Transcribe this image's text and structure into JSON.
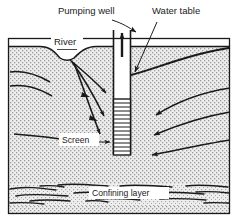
{
  "figure": {
    "type": "cross-section-diagram",
    "background_color": "#ffffff",
    "line_color": "#1a1a1a",
    "aquifer_fill": "#e8e8e8",
    "frame": {
      "x": 8,
      "y": 38,
      "width": 222,
      "height": 176
    }
  },
  "labels": {
    "pumping_well": "Pumping well",
    "water_table": "Water table",
    "river": "River",
    "screen": "Screen",
    "confining_layer": "Confining layer"
  },
  "label_positions": {
    "pumping_well": {
      "x": 58,
      "y": 14
    },
    "water_table": {
      "x": 152,
      "y": 14
    },
    "river": {
      "x": 54,
      "y": 45
    },
    "screen": {
      "x": 62,
      "y": 142
    },
    "confining_layer": {
      "x": 92,
      "y": 196
    }
  },
  "elements": {
    "well": {
      "name": "pumping-well-casing",
      "casing_left_x": 113,
      "casing_right_x": 131,
      "top_y": 30,
      "screen_top_y": 99,
      "screen_bottom_y": 155,
      "screen_hatch_lines": 14,
      "discharge_arrow": "up"
    },
    "river": {
      "name": "river-channel",
      "surface_y": 47,
      "bed_low_y": 60
    },
    "confining_layer": {
      "name": "confining-layer-band",
      "top_y": 183,
      "bottom_y": 205,
      "lens_count": 16
    },
    "flow_lines": {
      "left_of_river": 2,
      "river_to_well": 3,
      "deep_left": 1,
      "right_to_well": 3
    }
  },
  "annotations": {
    "pumping_well_leader": "arrow from label down-right to well casing",
    "water_table_leader": "arrow from label down-left to water table curve at well",
    "screen_leader": "arrow from label right to well screen"
  }
}
